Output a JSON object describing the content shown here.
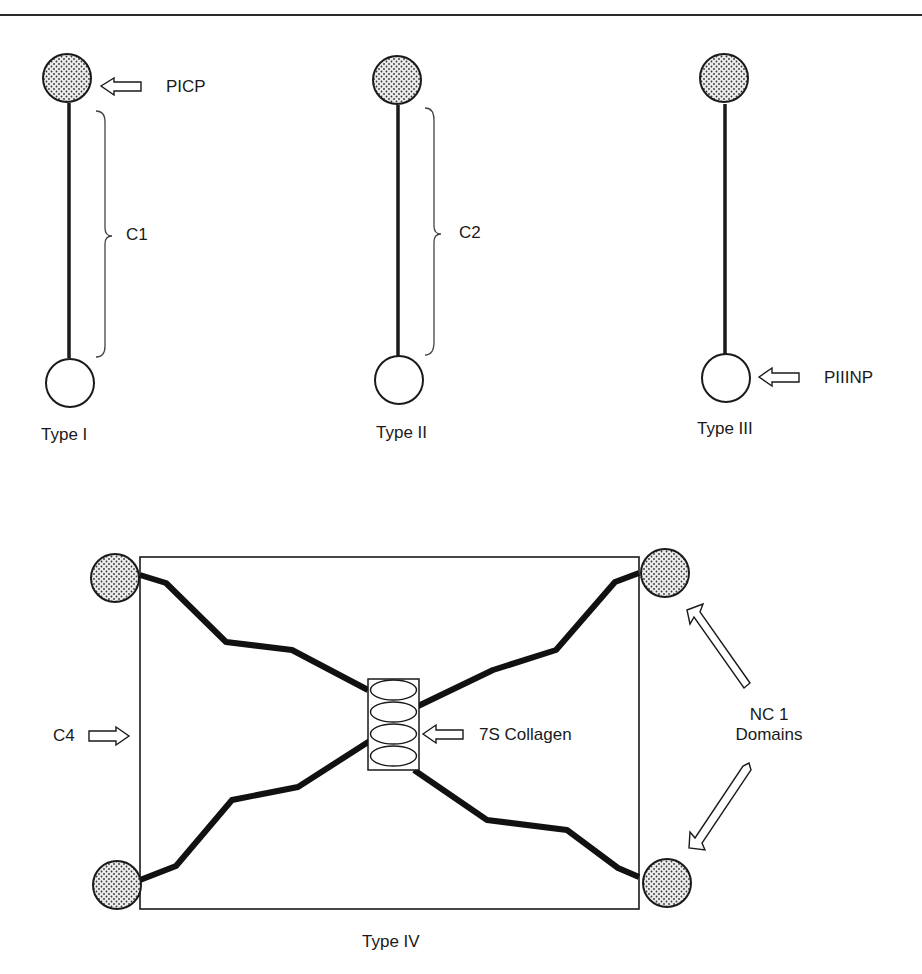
{
  "figure": {
    "type": "collagen-structure-diagram",
    "colors": {
      "stroke": "#1a1a1a",
      "globule_fill": "#e8e8e8",
      "dot": "#333333",
      "background": "#ffffff"
    }
  },
  "panels": {
    "type1": {
      "caption": "Type I",
      "top_globule": "stippled",
      "bottom_globule": "open",
      "top_arrow_label": "PICP",
      "brace_label": "C1"
    },
    "type2": {
      "caption": "Type II",
      "top_globule": "stippled",
      "bottom_globule": "open",
      "brace_label": "C2"
    },
    "type3": {
      "caption": "Type III",
      "top_globule": "stippled",
      "bottom_globule": "open",
      "bottom_arrow_label": "PIIINP"
    },
    "type4": {
      "caption": "Type IV",
      "left_arrow_label": "C4",
      "center_arrow_label": "7S Collagen",
      "domains_label_line1": "NC 1",
      "domains_label_line2": "Domains",
      "corner_globules": 4,
      "center_ellipses": 4
    }
  }
}
